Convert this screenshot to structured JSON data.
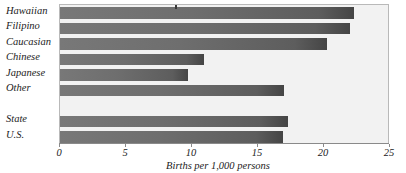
{
  "chart_data": {
    "type": "bar",
    "orientation": "horizontal",
    "title": "",
    "subtitle": "",
    "xlabel": "Births per 1,000 persons",
    "ylabel": "",
    "xlim": [
      0,
      25
    ],
    "xticks": [
      0,
      5,
      10,
      15,
      20,
      25
    ],
    "xtick_labels": [
      "0",
      "5",
      "10",
      "15",
      "20",
      "25"
    ],
    "grid": false,
    "legend": "none",
    "categories": [
      "Hawaiian",
      "Filipino",
      "Caucasian",
      "Chinese",
      "Japanese",
      "Other",
      "",
      "State",
      "U.S."
    ],
    "values": [
      22.3,
      22.0,
      20.2,
      10.9,
      9.7,
      17.0,
      null,
      17.3,
      16.9
    ],
    "series": [
      {
        "name": "Birth rate",
        "values": [
          22.3,
          22.0,
          20.2,
          10.9,
          9.7,
          17.0,
          null,
          17.3,
          16.9
        ]
      }
    ],
    "bars": [
      {
        "label": "Hawaiian",
        "value": 22.3
      },
      {
        "label": "Filipino",
        "value": 22.0
      },
      {
        "label": "Caucasian",
        "value": 20.2
      },
      {
        "label": "Chinese",
        "value": 10.9
      },
      {
        "label": "Japanese",
        "value": 9.7
      },
      {
        "label": "Other",
        "value": 17.0
      },
      {
        "label": "",
        "value": null
      },
      {
        "label": "State",
        "value": 17.3
      },
      {
        "label": "U.S.",
        "value": 16.9
      }
    ],
    "colors": {
      "bar_fill": "#6e6e6e",
      "bar_edge": "#454545",
      "plot_background": "#f2f2f2",
      "frame": "#b9b9b9",
      "axis": "#8a8a8a",
      "text": "#1b1b1b",
      "page_background": "#ffffff"
    }
  }
}
